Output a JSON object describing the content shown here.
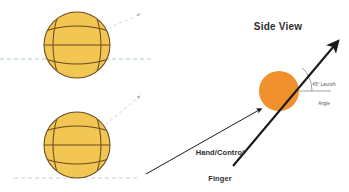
{
  "figure": {
    "title_right_panel": "Side View",
    "labels": {
      "hand_control_line1": "Hand/Control",
      "hand_control_line2": "Finger",
      "launch_angle_line1": "45° Launch",
      "launch_angle_line2": "Angle"
    },
    "colors": {
      "ball_yellow_fill": "#F2C652",
      "ball_yellow_stroke": "#6B4A1E",
      "ball_orange_fill": "#F0912D",
      "arrow_black": "#1A1A1A",
      "dashed_blue": "#A9C4D6",
      "dashed_gray": "#C9C9C9",
      "arc_gray": "#8A8A8A",
      "text_dark": "#2E2E2E",
      "background": "#FFFFFF"
    },
    "left_panel": {
      "balls": [
        {
          "name": "top-ball",
          "center_x": 77,
          "center_y": 45,
          "radius": 33,
          "seam_style": "horizontal-equator-with-vertical-seams",
          "baseline_y": 59,
          "spin_arrow_angle_deg": 45
        },
        {
          "name": "bottom-ball",
          "center_x": 77,
          "center_y": 145,
          "radius": 33,
          "seam_style": "horizontal-equator-with-vertical-seams",
          "baseline_y": 178,
          "spin_arrow_angle_deg": 45
        }
      ]
    },
    "right_panel": {
      "ball": {
        "name": "side-view-ball",
        "center_x": 279,
        "center_y": 91,
        "radius": 20
      },
      "launch_arrow": {
        "from_x": 232,
        "from_y": 167,
        "to_x": 338,
        "to_y": 42,
        "angle_deg": 45
      },
      "horizontal_reference": {
        "from_x": 279,
        "from_y": 91,
        "to_x": 330,
        "to_y": 91
      },
      "angle_arc_radius": 33
    }
  }
}
